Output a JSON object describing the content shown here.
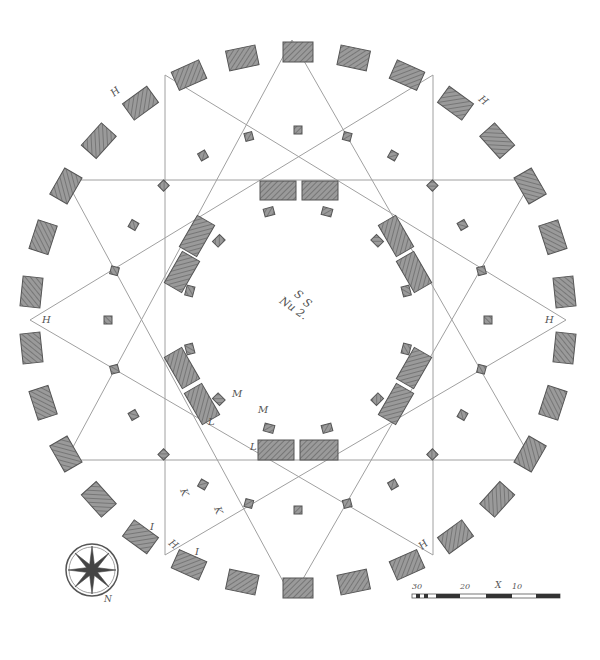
{
  "title": "Nu 2.",
  "center_labels": [
    "S",
    "S",
    "Nu 2."
  ],
  "point_labels": {
    "H": "H",
    "M": "M",
    "L": "L",
    "K": "K",
    "I": "I"
  },
  "scale_bar": {
    "labels": [
      "30",
      "20",
      "X",
      "10"
    ]
  },
  "compass": {
    "label": "N"
  },
  "colors": {
    "ink": "#555555",
    "fill": "#8a8a8a",
    "line": "#999999"
  }
}
